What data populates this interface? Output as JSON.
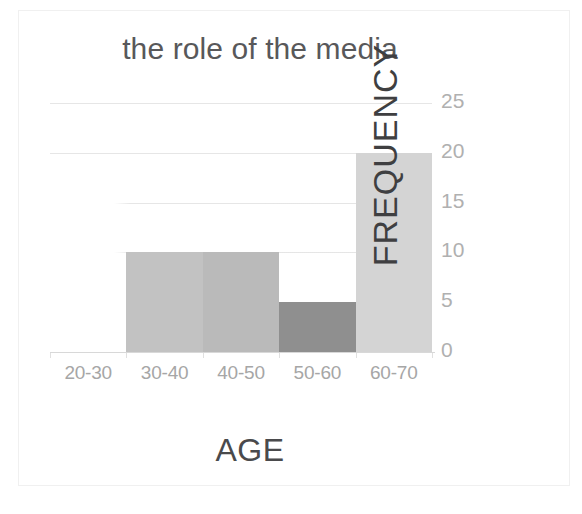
{
  "chart_data": {
    "type": "bar",
    "title": "the role of the media",
    "xlabel": "AGE",
    "ylabel": "FREQUENCY",
    "categories": [
      "20-30",
      "30-40",
      "40-50",
      "50-60",
      "60-70"
    ],
    "values": [
      0,
      10,
      10,
      5,
      20
    ],
    "series": [
      {
        "name": "FREQUENCY",
        "values": [
          0,
          10,
          10,
          5,
          20
        ]
      }
    ],
    "ylim": [
      0,
      25
    ],
    "yticks": [
      0,
      5,
      10,
      15,
      20,
      25
    ],
    "ytick_labels": [
      "0",
      "5",
      "10",
      "15",
      "20",
      "25"
    ],
    "grid": true,
    "gridlines_at": [
      25,
      20,
      15,
      10
    ],
    "legend": false,
    "y_axis_position": "right",
    "bar_colors": [
      "#ffffff",
      "#c2c2c2",
      "#bababa",
      "#8f8f8f",
      "#d4d4d4"
    ],
    "bars": [
      {
        "category": "20-30",
        "value": 0,
        "color": "#ffffff"
      },
      {
        "category": "30-40",
        "value": 10,
        "color": "#c2c2c2"
      },
      {
        "category": "40-50",
        "value": 10,
        "color": "#bababa"
      },
      {
        "category": "50-60",
        "value": 5,
        "color": "#8f8f8f"
      },
      {
        "category": "60-70",
        "value": 20,
        "color": "#d4d4d4"
      }
    ],
    "colors": {
      "title_text": "#58585a",
      "tick_text": "#a6a6a6",
      "axis_title_text": "#3f3f41",
      "gridline": "#e6e6e6",
      "axis_line": "#d8d8d8",
      "background": "#ffffff",
      "page_border": "#f0f0f0"
    }
  }
}
